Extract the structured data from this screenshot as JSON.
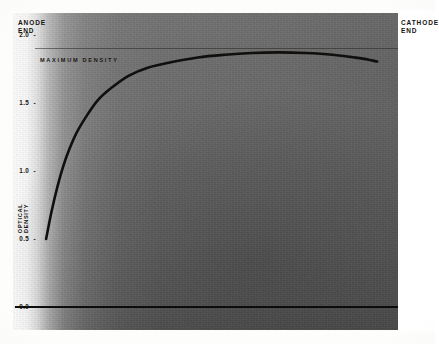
{
  "figure": {
    "anode_label_line1": "ANODE",
    "anode_label_line2": "END",
    "cathode_label_line1": "CATHODE",
    "cathode_label_line2": "END",
    "annotation_maximum_density": "MAXIMUM DENSITY",
    "y_axis_title_line1": "OPTICAL",
    "y_axis_title_line2": "DENSITY",
    "tick_dash": "-",
    "colors": {
      "curve": "#100f0d",
      "baseline": "#0d0c0a",
      "max_density_rule": "#2a2622",
      "film_gray": "#6a6a6a",
      "anode_white": "#ffffff",
      "text": "#15120f"
    }
  },
  "chart_data": {
    "type": "line",
    "title": "",
    "subtitle": "",
    "xlabel": "",
    "ylabel": "OPTICAL DENSITY",
    "xlim": [
      0,
      100
    ],
    "ylim": [
      0.0,
      2.0
    ],
    "grid": false,
    "legend_position": "none",
    "x_tick_labels": [
      "ANODE END",
      "CATHODE END"
    ],
    "y_ticks": [
      0.0,
      0.5,
      1.0,
      1.5,
      2.0
    ],
    "y_tick_labels": [
      "0.0",
      "0.5",
      "1.0",
      "1.5",
      "2.0"
    ],
    "annotations": [
      {
        "text": "MAXIMUM DENSITY",
        "y": 1.9,
        "type": "horizontal-reference-line"
      }
    ],
    "series": [
      {
        "name": "optical density profile",
        "x": [
          8.6,
          10.0,
          11.5,
          13.0,
          14.5,
          16.5,
          19.0,
          22.0,
          25.5,
          30.0,
          35.0,
          41.0,
          48.0,
          55.0,
          62.0,
          69.0,
          76.0,
          83.0,
          90.0,
          94.6
        ],
        "values": [
          0.5,
          0.7,
          0.88,
          1.03,
          1.15,
          1.28,
          1.4,
          1.52,
          1.61,
          1.7,
          1.76,
          1.8,
          1.835,
          1.855,
          1.868,
          1.872,
          1.868,
          1.855,
          1.83,
          1.805
        ]
      },
      {
        "name": "zero baseline",
        "x": [
          0.5,
          100.0
        ],
        "values": [
          0.0,
          0.0
        ]
      }
    ]
  }
}
